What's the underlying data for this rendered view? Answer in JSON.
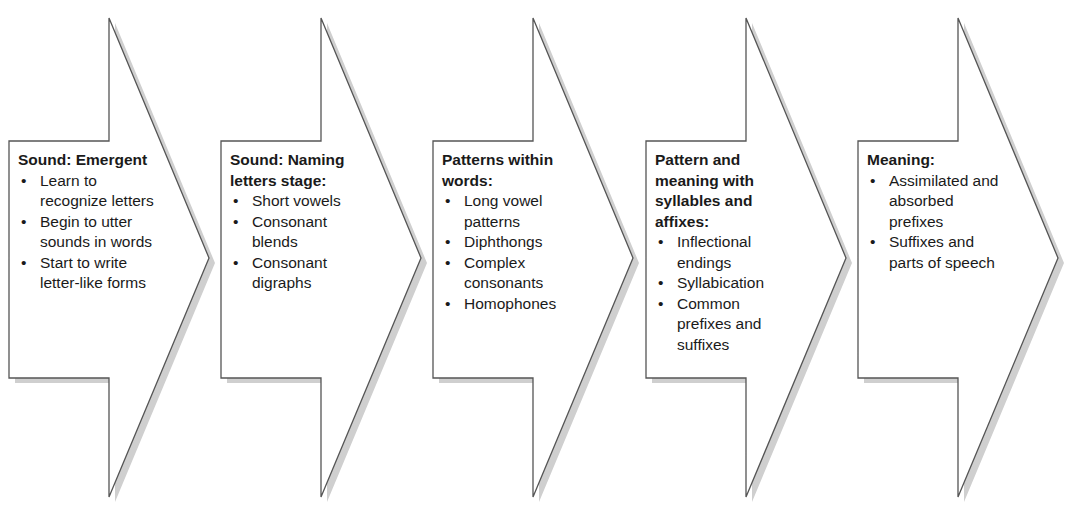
{
  "diagram": {
    "type": "chevron-process",
    "colors": {
      "fill": "#ffffff",
      "stroke": "#555555",
      "shadow": "#cfcfcf",
      "text": "#1a1a1a"
    },
    "bullet_glyph": "•",
    "stages": [
      {
        "title": "Sound: Emergent",
        "items": [
          "Learn to recognize letters",
          "Begin to utter sounds in words",
          "Start to write letter-like forms"
        ]
      },
      {
        "title": "Sound: Naming letters stage:",
        "items": [
          "Short vowels",
          "Consonant blends",
          "Consonant digraphs"
        ]
      },
      {
        "title": "Patterns within words:",
        "items": [
          "Long vowel patterns",
          "Diphthongs",
          "Complex consonants",
          "Homophones"
        ]
      },
      {
        "title": "Pattern and meaning with syllables and affixes:",
        "items": [
          "Inflectional endings",
          "Syllabication",
          "Common prefixes and suffixes"
        ]
      },
      {
        "title": "Meaning:",
        "items": [
          "Assimilated and absorbed prefixes",
          "Suffixes and parts of speech"
        ]
      }
    ]
  }
}
